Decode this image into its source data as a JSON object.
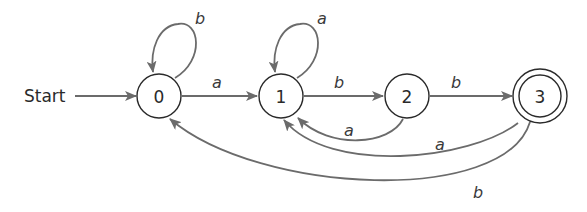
{
  "diagram": {
    "type": "finite-automaton",
    "start_label": "Start",
    "start_state": "0",
    "accepting_states": [
      "3"
    ],
    "states": [
      {
        "id": "0",
        "label": "0",
        "accepting": false
      },
      {
        "id": "1",
        "label": "1",
        "accepting": false
      },
      {
        "id": "2",
        "label": "2",
        "accepting": false
      },
      {
        "id": "3",
        "label": "3",
        "accepting": true
      }
    ],
    "transitions": [
      {
        "from": "0",
        "to": "0",
        "label": "b"
      },
      {
        "from": "0",
        "to": "1",
        "label": "a"
      },
      {
        "from": "1",
        "to": "1",
        "label": "a"
      },
      {
        "from": "1",
        "to": "2",
        "label": "b"
      },
      {
        "from": "2",
        "to": "1",
        "label": "a"
      },
      {
        "from": "2",
        "to": "3",
        "label": "b"
      },
      {
        "from": "3",
        "to": "1",
        "label": "a"
      },
      {
        "from": "3",
        "to": "0",
        "label": "b"
      }
    ],
    "colors": {
      "edge": "#6b6b6b",
      "node_stroke": "#2a2a2a",
      "background": "#ffffff"
    }
  }
}
